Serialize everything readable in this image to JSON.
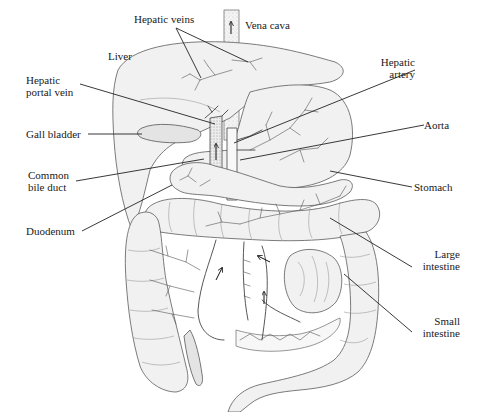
{
  "diagram": {
    "labels": [
      {
        "id": "hepatic-veins",
        "text": "Hepatic veins",
        "x": 134,
        "y": 13,
        "align": "left"
      },
      {
        "id": "vena-cava",
        "text": "Vena cava",
        "x": 245,
        "y": 21,
        "align": "left"
      },
      {
        "id": "liver",
        "text": "Liver",
        "x": 108,
        "y": 51,
        "align": "left"
      },
      {
        "id": "hepatic-portal-vein",
        "text": "Hepatic\nportal vein",
        "x": 26,
        "y": 74,
        "align": "left"
      },
      {
        "id": "hepatic-artery",
        "text": "Hepatic\nartery",
        "x": 404,
        "y": 56,
        "align": "right",
        "right": 271
      },
      {
        "id": "gall-bladder",
        "text": "Gall bladder",
        "x": 26,
        "y": 129,
        "align": "left"
      },
      {
        "id": "aorta",
        "text": "Aorta",
        "x": 424,
        "y": 119,
        "align": "left"
      },
      {
        "id": "common-bile-duct",
        "text": "Common\nbile duct",
        "x": 28,
        "y": 169,
        "align": "left"
      },
      {
        "id": "stomach",
        "text": "Stomach",
        "x": 414,
        "y": 181,
        "align": "left"
      },
      {
        "id": "duodenum",
        "text": "Duodenum",
        "x": 26,
        "y": 225,
        "align": "left"
      },
      {
        "id": "large-intestine",
        "text": "Large\nintestine",
        "x": 414,
        "y": 248,
        "align": "right",
        "right": 270
      },
      {
        "id": "small-intestine",
        "text": "Small\nintestine",
        "x": 414,
        "y": 315,
        "align": "right",
        "right": 270
      }
    ],
    "leader_lines": [
      {
        "id": "hepatic-veins-1",
        "x1": 176,
        "y1": 28,
        "x2": 201,
        "y2": 78
      },
      {
        "id": "hepatic-veins-2",
        "x1": 176,
        "y1": 28,
        "x2": 248,
        "y2": 62
      },
      {
        "id": "hepatic-portal-vein",
        "x1": 80,
        "y1": 84,
        "x2": 215,
        "y2": 124
      },
      {
        "id": "hepatic-artery",
        "x1": 415,
        "y1": 70,
        "x2": 234,
        "y2": 143
      },
      {
        "id": "gall-bladder",
        "x1": 88,
        "y1": 134,
        "x2": 142,
        "y2": 134
      },
      {
        "id": "aorta",
        "x1": 424,
        "y1": 125,
        "x2": 240,
        "y2": 160
      },
      {
        "id": "common-bile-duct",
        "x1": 76,
        "y1": 181,
        "x2": 204,
        "y2": 159
      },
      {
        "id": "stomach",
        "x1": 412,
        "y1": 187,
        "x2": 330,
        "y2": 171
      },
      {
        "id": "duodenum",
        "x1": 82,
        "y1": 231,
        "x2": 172,
        "y2": 185
      },
      {
        "id": "large-intestine",
        "x1": 412,
        "y1": 267,
        "x2": 330,
        "y2": 218
      },
      {
        "id": "small-intestine",
        "x1": 412,
        "y1": 332,
        "x2": 344,
        "y2": 274
      }
    ],
    "flow_arrows": [
      {
        "id": "vena-cava-arrow",
        "x": 232,
        "y": 20,
        "direction": "up"
      },
      {
        "id": "portal-vein-arrow",
        "x": 216,
        "y": 152,
        "direction": "up"
      },
      {
        "id": "aorta-arrow",
        "x": 232,
        "y": 152,
        "direction": "down"
      },
      {
        "id": "mesenteric-arrow-left",
        "x": 218,
        "y": 275,
        "direction": "up-right"
      },
      {
        "id": "mesenteric-arrow-center",
        "x": 264,
        "y": 255,
        "direction": "up-left"
      },
      {
        "id": "mesenteric-arrow-lower",
        "x": 264,
        "y": 300,
        "direction": "up"
      }
    ],
    "colors": {
      "background": "#ffffff",
      "ink": "#1a1a1a",
      "stipple": "#f1f1f1"
    }
  }
}
